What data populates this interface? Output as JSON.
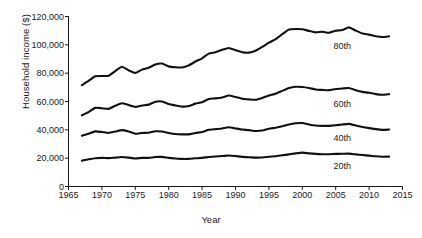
{
  "chart_data": {
    "type": "line",
    "title": "",
    "xlabel": "Year",
    "ylabel": "Household income ($)",
    "xlim": [
      1965,
      2015
    ],
    "ylim": [
      0,
      120000
    ],
    "grid": false,
    "legend_position": "inline-right",
    "x_ticks": [
      1965,
      1970,
      1975,
      1980,
      1985,
      1990,
      1995,
      2000,
      2005,
      2010,
      2015
    ],
    "x_tick_labels": [
      "1965",
      "1970",
      "1975",
      "1980",
      "1985",
      "1990",
      "1995",
      "2000",
      "2005",
      "2010",
      "2015"
    ],
    "y_ticks": [
      0,
      20000,
      40000,
      60000,
      80000,
      100000,
      120000
    ],
    "y_tick_labels": [
      "0",
      "20,000",
      "40,000",
      "60,000",
      "80,000",
      "100,000",
      "120,000"
    ],
    "x": [
      1967,
      1968,
      1969,
      1970,
      1971,
      1972,
      1973,
      1974,
      1975,
      1976,
      1977,
      1978,
      1979,
      1980,
      1981,
      1982,
      1983,
      1984,
      1985,
      1986,
      1987,
      1988,
      1989,
      1990,
      1991,
      1992,
      1993,
      1994,
      1995,
      1996,
      1997,
      1998,
      1999,
      2000,
      2001,
      2002,
      2003,
      2004,
      2005,
      2006,
      2007,
      2008,
      2009,
      2010,
      2011,
      2012,
      2013
    ],
    "series": [
      {
        "name": "80th",
        "label": "80th",
        "color": "#111111",
        "values": [
          71500,
          74500,
          77800,
          78000,
          78200,
          81500,
          84500,
          82000,
          80200,
          82500,
          83800,
          86200,
          86800,
          84800,
          84200,
          84000,
          85500,
          88200,
          90500,
          93800,
          94800,
          96500,
          97800,
          96200,
          94800,
          94500,
          95800,
          98500,
          101500,
          104000,
          107500,
          110800,
          111200,
          111000,
          109800,
          108800,
          109200,
          108500,
          110000,
          110500,
          112300,
          110000,
          108000,
          107200,
          106000,
          105500,
          106000
        ]
      },
      {
        "name": "60th",
        "label": "60th",
        "color": "#111111",
        "values": [
          50200,
          52500,
          55500,
          55200,
          54800,
          57000,
          58800,
          57500,
          56200,
          57200,
          57800,
          59800,
          60000,
          58200,
          57200,
          56400,
          56800,
          58500,
          59500,
          61800,
          62200,
          62800,
          64200,
          63200,
          62000,
          61500,
          61200,
          62500,
          64200,
          65500,
          67500,
          69500,
          70400,
          70200,
          69500,
          68500,
          68200,
          68000,
          68800,
          69200,
          69500,
          68000,
          66800,
          66200,
          65200,
          64800,
          65200
        ]
      },
      {
        "name": "40th",
        "label": "40th",
        "color": "#111111",
        "values": [
          35800,
          37200,
          38900,
          38500,
          37800,
          38800,
          39800,
          38800,
          37200,
          37800,
          38000,
          39000,
          38800,
          37800,
          37000,
          36800,
          36800,
          37800,
          38500,
          40000,
          40500,
          41000,
          41800,
          41000,
          40200,
          39800,
          39200,
          39500,
          40800,
          41500,
          42500,
          43800,
          44600,
          44800,
          43800,
          43000,
          42800,
          42800,
          43200,
          43800,
          44200,
          43000,
          42000,
          41200,
          40500,
          40000,
          40200
        ]
      },
      {
        "name": "20th",
        "label": "20th",
        "color": "#111111",
        "values": [
          18200,
          19200,
          20000,
          20200,
          20000,
          20400,
          20800,
          20400,
          19800,
          20200,
          20200,
          20800,
          20900,
          20200,
          19800,
          19500,
          19500,
          19900,
          20200,
          20800,
          21200,
          21500,
          21900,
          21500,
          20900,
          20700,
          20400,
          20500,
          21000,
          21400,
          22000,
          22700,
          23400,
          23900,
          23400,
          23000,
          22800,
          22800,
          23000,
          23100,
          23200,
          22700,
          22200,
          21800,
          21300,
          21000,
          21100
        ]
      }
    ],
    "series_label_positions": [
      {
        "name": "80th",
        "x": 2006,
        "y": 99000
      },
      {
        "name": "60th",
        "x": 2006,
        "y": 58500
      },
      {
        "name": "40th",
        "x": 2006,
        "y": 34500
      },
      {
        "name": "20th",
        "x": 2006,
        "y": 14500
      }
    ]
  }
}
